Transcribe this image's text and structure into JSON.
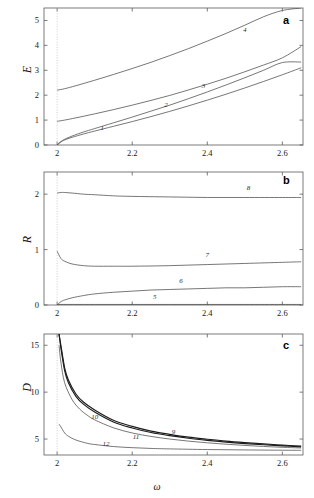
{
  "figure": {
    "xaxis_title": "ω",
    "panels": [
      {
        "letter": "a",
        "ylabel": "E",
        "yticks": [
          "0",
          "1",
          "2",
          "3",
          "4",
          "5"
        ],
        "xticks": [
          "2",
          "2.2",
          "2.4",
          "2.6"
        ],
        "curve_labels": [
          "1",
          "2",
          "3",
          "4"
        ]
      },
      {
        "letter": "b",
        "ylabel": "R",
        "yticks": [
          "0",
          "1",
          "2"
        ],
        "xticks": [
          "2",
          "2.2",
          "2.4",
          "2.6"
        ],
        "curve_labels": [
          "5",
          "6",
          "7",
          "8"
        ]
      },
      {
        "letter": "c",
        "ylabel": "D",
        "yticks": [
          "5",
          "10",
          "15"
        ],
        "xticks": [
          "2",
          "2.2",
          "2.4",
          "2.6"
        ],
        "curve_labels": [
          "9",
          "10",
          "11",
          "12"
        ]
      }
    ]
  },
  "chart_data": [
    {
      "type": "line",
      "title": "",
      "panel": "a",
      "xlabel": "ω",
      "ylabel": "E",
      "xlim": [
        1.965,
        2.655
      ],
      "ylim": [
        0,
        5.5
      ],
      "xticks": [
        2,
        2.2,
        2.4,
        2.6
      ],
      "yticks": [
        0,
        1,
        2,
        3,
        4,
        5
      ],
      "grid": false,
      "vertical_marker": 2.0,
      "series": [
        {
          "name": "1",
          "label_at": [
            2.12,
            0.62
          ],
          "x": [
            2.0,
            2.01,
            2.02,
            2.04,
            2.07,
            2.1,
            2.15,
            2.2,
            2.25,
            2.3,
            2.35,
            2.4,
            2.45,
            2.5,
            2.55,
            2.6,
            2.65
          ],
          "values": [
            0.0,
            0.12,
            0.2,
            0.31,
            0.44,
            0.56,
            0.75,
            0.94,
            1.14,
            1.35,
            1.57,
            1.8,
            2.04,
            2.29,
            2.55,
            2.82,
            3.1
          ]
        },
        {
          "name": "2",
          "label_at": [
            2.29,
            1.52
          ],
          "x": [
            2.0,
            2.01,
            2.02,
            2.04,
            2.07,
            2.1,
            2.15,
            2.2,
            2.25,
            2.3,
            2.35,
            2.4,
            2.45,
            2.5,
            2.55,
            2.6,
            2.65
          ],
          "values": [
            0.0,
            0.14,
            0.23,
            0.36,
            0.52,
            0.66,
            0.89,
            1.12,
            1.36,
            1.6,
            1.86,
            2.13,
            2.41,
            2.7,
            3.0,
            3.31,
            3.33
          ]
        },
        {
          "name": "3",
          "label_at": [
            2.39,
            2.29
          ],
          "x": [
            2.0,
            2.02,
            2.05,
            2.1,
            2.15,
            2.2,
            2.25,
            2.3,
            2.35,
            2.4,
            2.45,
            2.5,
            2.55,
            2.6,
            2.65
          ],
          "values": [
            0.95,
            1.0,
            1.09,
            1.25,
            1.42,
            1.6,
            1.79,
            1.99,
            2.21,
            2.44,
            2.68,
            2.94,
            3.21,
            3.5,
            3.95
          ]
        },
        {
          "name": "4",
          "label_at": [
            2.5,
            4.52
          ],
          "x": [
            2.0,
            2.02,
            2.05,
            2.1,
            2.15,
            2.2,
            2.25,
            2.3,
            2.35,
            2.4,
            2.45,
            2.5,
            2.55,
            2.6,
            2.65
          ],
          "values": [
            2.2,
            2.26,
            2.38,
            2.6,
            2.83,
            3.07,
            3.32,
            3.59,
            3.87,
            4.17,
            4.48,
            4.81,
            5.15,
            5.4,
            5.5
          ]
        }
      ]
    },
    {
      "type": "line",
      "title": "",
      "panel": "b",
      "xlabel": "ω",
      "ylabel": "R",
      "xlim": [
        1.965,
        2.655
      ],
      "ylim": [
        0,
        2.4
      ],
      "xticks": [
        2,
        2.2,
        2.4,
        2.6
      ],
      "yticks": [
        0,
        1,
        2
      ],
      "grid": false,
      "vertical_marker": 2.0,
      "series": [
        {
          "name": "5",
          "label_at": [
            2.26,
            0.1
          ],
          "x": [
            2.0,
            2.1,
            2.2,
            2.3,
            2.4,
            2.5,
            2.6,
            2.65
          ],
          "values": [
            0.01,
            0.01,
            0.01,
            0.01,
            0.01,
            0.01,
            0.01,
            0.01
          ]
        },
        {
          "name": "6",
          "label_at": [
            2.33,
            0.4
          ],
          "x": [
            2.0,
            2.01,
            2.02,
            2.04,
            2.07,
            2.1,
            2.15,
            2.2,
            2.25,
            2.3,
            2.35,
            2.4,
            2.45,
            2.5,
            2.55,
            2.6,
            2.65
          ],
          "values": [
            0.0,
            0.06,
            0.09,
            0.13,
            0.17,
            0.2,
            0.23,
            0.25,
            0.27,
            0.28,
            0.29,
            0.3,
            0.31,
            0.31,
            0.32,
            0.33,
            0.33
          ]
        },
        {
          "name": "7",
          "label_at": [
            2.4,
            0.86
          ],
          "x": [
            2.0,
            2.01,
            2.02,
            2.04,
            2.07,
            2.1,
            2.15,
            2.2,
            2.3,
            2.4,
            2.5,
            2.6,
            2.65
          ],
          "values": [
            0.97,
            0.84,
            0.79,
            0.74,
            0.71,
            0.7,
            0.7,
            0.7,
            0.71,
            0.73,
            0.75,
            0.77,
            0.78
          ]
        },
        {
          "name": "8",
          "label_at": [
            2.51,
            2.08
          ],
          "x": [
            2.0,
            2.01,
            2.02,
            2.04,
            2.07,
            2.1,
            2.15,
            2.2,
            2.3,
            2.4,
            2.5,
            2.6,
            2.65
          ],
          "values": [
            2.02,
            2.03,
            2.03,
            2.02,
            2.0,
            1.99,
            1.97,
            1.96,
            1.95,
            1.94,
            1.94,
            1.94,
            1.94
          ]
        }
      ]
    },
    {
      "type": "line",
      "title": "",
      "panel": "c",
      "xlabel": "ω",
      "ylabel": "D",
      "xlim": [
        1.965,
        2.655
      ],
      "ylim": [
        3.3,
        16.2
      ],
      "xticks": [
        2,
        2.2,
        2.4,
        2.6
      ],
      "yticks": [
        5,
        10,
        15
      ],
      "grid": false,
      "vertical_marker": 2.0,
      "series": [
        {
          "name": "9",
          "label_at": [
            2.31,
            5.55
          ],
          "x": [
            2.005,
            2.01,
            2.02,
            2.03,
            2.05,
            2.07,
            2.1,
            2.15,
            2.2,
            2.25,
            2.3,
            2.35,
            2.4,
            2.45,
            2.5,
            2.55,
            2.6,
            2.65
          ],
          "values": [
            16.2,
            15.0,
            12.6,
            11.3,
            9.8,
            8.95,
            8.1,
            7.0,
            6.35,
            5.85,
            5.5,
            5.2,
            4.98,
            4.78,
            4.62,
            4.48,
            4.35,
            4.25
          ]
        },
        {
          "name": "10",
          "label_at": [
            2.1,
            7.1
          ],
          "x": [
            2.005,
            2.01,
            2.02,
            2.03,
            2.05,
            2.07,
            2.1,
            2.15,
            2.2,
            2.25,
            2.3,
            2.35,
            2.4,
            2.45,
            2.5,
            2.55,
            2.6,
            2.65
          ],
          "values": [
            16.2,
            14.7,
            12.3,
            11.0,
            9.55,
            8.72,
            7.88,
            6.82,
            6.18,
            5.7,
            5.36,
            5.08,
            4.86,
            4.68,
            4.52,
            4.39,
            4.27,
            4.17
          ]
        },
        {
          "name": "11",
          "label_at": [
            2.21,
            5.05
          ],
          "x": [
            2.005,
            2.01,
            2.02,
            2.04,
            2.06,
            2.08,
            2.1,
            2.15,
            2.2,
            2.25,
            2.3,
            2.35,
            2.4,
            2.45,
            2.5,
            2.55,
            2.6,
            2.65
          ],
          "values": [
            15.0,
            13.2,
            11.0,
            9.2,
            8.2,
            7.55,
            7.05,
            6.2,
            5.65,
            5.28,
            5.0,
            4.78,
            4.6,
            4.45,
            4.32,
            4.21,
            4.12,
            4.05
          ]
        },
        {
          "name": "12",
          "label_at": [
            2.13,
            4.3
          ],
          "x": [
            2.005,
            2.01,
            2.02,
            2.03,
            2.05,
            2.08,
            2.1,
            2.15,
            2.2,
            2.25,
            2.3,
            2.4,
            2.5,
            2.6,
            2.65
          ],
          "values": [
            6.6,
            6.3,
            5.65,
            5.3,
            4.9,
            4.55,
            4.42,
            4.2,
            4.08,
            4.0,
            3.95,
            3.88,
            3.84,
            3.81,
            3.8
          ]
        }
      ]
    }
  ]
}
